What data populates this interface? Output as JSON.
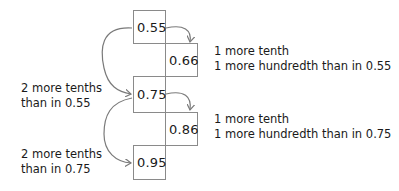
{
  "diagram": {
    "type": "decimal-step-comparison",
    "boxes": [
      {
        "id": "b1",
        "value": "0.55"
      },
      {
        "id": "b2",
        "value": "0.66"
      },
      {
        "id": "b3",
        "value": "0.75"
      },
      {
        "id": "b4",
        "value": "0.86"
      },
      {
        "id": "b5",
        "value": "0.95"
      }
    ],
    "right_notes": [
      {
        "line1": "1 more tenth",
        "line2": "1 more hundredth than in 0.55"
      },
      {
        "line1": "1 more tenth",
        "line2": "1 more hundredth than in 0.75"
      }
    ],
    "left_notes": [
      {
        "line1": "2 more tenths",
        "line2": "than in 0.55"
      },
      {
        "line1": "2 more tenths",
        "line2": "than in 0.75"
      }
    ],
    "colors": {
      "box_border": "#8a8a8a",
      "arrow": "#7a7a7a",
      "text": "#1a1a1a"
    }
  }
}
